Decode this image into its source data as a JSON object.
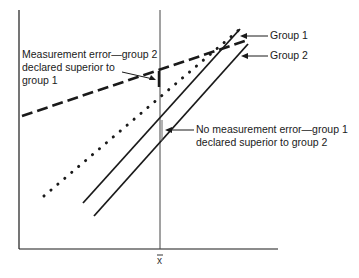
{
  "figure": {
    "type": "diagram",
    "x_axis_label": "x̄",
    "colors": {
      "ink": "#1a1a1a",
      "background": "#ffffff"
    }
  },
  "lines": [
    {
      "id": "group1-true",
      "style": "solid",
      "from": [
        83,
        203
      ],
      "to": [
        240,
        29
      ],
      "label": "Group 1"
    },
    {
      "id": "group2-true",
      "style": "solid",
      "from": [
        94,
        216
      ],
      "to": [
        248,
        44
      ],
      "label": "Group 2"
    },
    {
      "id": "group1-error",
      "style": "dotted",
      "from": [
        44,
        196
      ],
      "to": [
        240,
        29
      ]
    },
    {
      "id": "group2-error",
      "style": "dashed",
      "from": [
        22,
        116
      ],
      "to": [
        248,
        40
      ]
    }
  ],
  "annotations": {
    "group1": "Group 1",
    "group2": "Group 2",
    "measurement_error_line1": "Measurement error—group 2",
    "measurement_error_line2": "declared superior to",
    "measurement_error_line3": "group 1",
    "no_error_line1": "No measurement error—group 1",
    "no_error_line2": "declared superior to group 2"
  }
}
